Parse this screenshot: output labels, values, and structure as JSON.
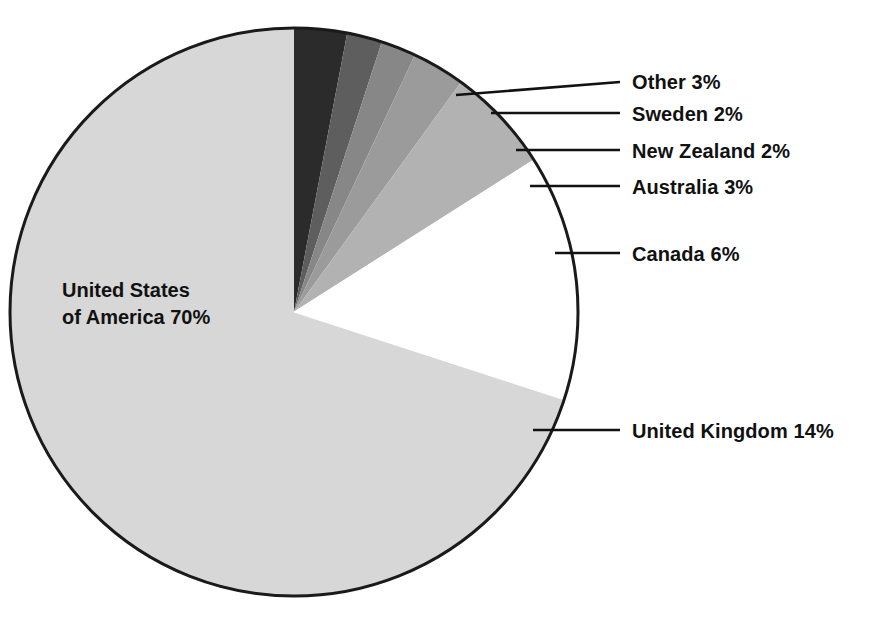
{
  "chart_data": {
    "type": "pie",
    "title": "",
    "subtitle": "",
    "xlabel": "",
    "ylabel": "",
    "legend_position": "callout-labels-right",
    "grid": false,
    "units": "percent",
    "start_angle_deg": 0,
    "direction": "clockwise",
    "categories": [
      "Other",
      "Sweden",
      "New Zealand",
      "Australia",
      "Canada",
      "United Kingdom",
      "United States of America"
    ],
    "values": [
      3,
      2,
      2,
      3,
      6,
      14,
      70
    ],
    "slices": [
      {
        "name": "other",
        "label": "Other 3%",
        "category": "Other",
        "value": 3,
        "value_text": "3%",
        "color": "#2b2b2b",
        "start_deg": 0,
        "end_deg": 10.8,
        "label_x": 632,
        "label_y": 71,
        "leader_tip_x": 456,
        "leader_tip_y": 95,
        "leader_end_x": 620,
        "leader_end_y": 82
      },
      {
        "name": "sweden",
        "label": "Sweden 2%",
        "category": "Sweden",
        "value": 2,
        "value_text": "2%",
        "color": "#5e5e5e",
        "start_deg": 10.8,
        "end_deg": 18.0,
        "label_x": 632,
        "label_y": 103,
        "leader_tip_x": 491,
        "leader_tip_y": 113,
        "leader_end_x": 620,
        "leader_end_y": 113
      },
      {
        "name": "new-zealand",
        "label": "New Zealand 2%",
        "category": "New Zealand",
        "value": 2,
        "value_text": "2%",
        "color": "#878787",
        "start_deg": 18.0,
        "end_deg": 25.2,
        "label_x": 632,
        "label_y": 140,
        "leader_tip_x": 516,
        "leader_tip_y": 150,
        "leader_end_x": 620,
        "leader_end_y": 150
      },
      {
        "name": "australia",
        "label": "Australia 3%",
        "category": "Australia",
        "value": 3,
        "value_text": "3%",
        "color": "#9b9b9b",
        "start_deg": 25.2,
        "end_deg": 36.0,
        "label_x": 632,
        "label_y": 176,
        "leader_tip_x": 530,
        "leader_tip_y": 186,
        "leader_end_x": 620,
        "leader_end_y": 186
      },
      {
        "name": "canada",
        "label": "Canada 6%",
        "category": "Canada",
        "value": 6,
        "value_text": "6%",
        "color": "#b2b2b2",
        "start_deg": 36.0,
        "end_deg": 57.6,
        "label_x": 632,
        "label_y": 243,
        "leader_tip_x": 555,
        "leader_tip_y": 253,
        "leader_end_x": 620,
        "leader_end_y": 253
      },
      {
        "name": "united-kingdom",
        "label": "United Kingdom 14%",
        "category": "United Kingdom",
        "value": 14,
        "value_text": "14%",
        "color": "#ffffff",
        "start_deg": 57.6,
        "end_deg": 108.0,
        "label_x": 632,
        "label_y": 420,
        "leader_tip_x": 533,
        "leader_tip_y": 430,
        "leader_end_x": 620,
        "leader_end_y": 430
      },
      {
        "name": "united-states-of-america",
        "label": "United States\nof America 70%",
        "category": "United States of America",
        "value": 70,
        "value_text": "70%",
        "color": "#d7d7d7",
        "start_deg": 108.0,
        "end_deg": 360.0,
        "label_x": 62,
        "label_y": 277,
        "leader_tip_x": null,
        "leader_tip_y": null,
        "leader_end_x": null,
        "leader_end_y": null
      }
    ],
    "geometry": {
      "center_x": 294,
      "center_y": 312,
      "radius": 284,
      "outline_color": "#1a1a1a",
      "outline_width": 3
    }
  },
  "canvas": {
    "width": 874,
    "height": 618,
    "background": "#ffffff"
  }
}
